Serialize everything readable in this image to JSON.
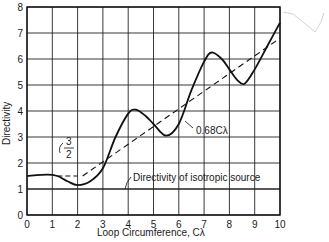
{
  "chart_data": {
    "type": "line",
    "title": "",
    "xlabel": "Loop Circumference, Cλ",
    "ylabel": "Directivity",
    "xlim": [
      0,
      10
    ],
    "ylim": [
      0,
      8
    ],
    "grid": true,
    "x_ticks": [
      "0",
      "1",
      "2",
      "3",
      "4",
      "5",
      "6",
      "7",
      "8",
      "9",
      "10"
    ],
    "y_ticks": [
      "0",
      "1",
      "2",
      "3",
      "4",
      "5",
      "6",
      "7",
      "8"
    ],
    "series": [
      {
        "name": "Directivity",
        "style": "solid",
        "x": [
          0,
          0.8,
          1.2,
          1.6,
          2.0,
          2.5,
          3.0,
          3.5,
          4.0,
          4.3,
          4.7,
          5.0,
          5.5,
          6.0,
          6.5,
          7.0,
          7.3,
          7.7,
          8.0,
          8.3,
          8.6,
          9.0,
          9.5,
          10.0
        ],
        "y": [
          1.5,
          1.55,
          1.5,
          1.3,
          1.15,
          1.3,
          1.8,
          3.0,
          3.9,
          4.05,
          3.8,
          3.5,
          3.05,
          3.5,
          4.8,
          5.9,
          6.25,
          6.0,
          5.6,
          5.2,
          5.05,
          5.6,
          6.5,
          7.4
        ]
      },
      {
        "name": "0.68Cλ",
        "style": "dashed",
        "x": [
          2.2,
          10.0
        ],
        "y": [
          1.5,
          6.8
        ]
      },
      {
        "name": "3/2 level",
        "style": "dashed",
        "x": [
          1.2,
          2.0
        ],
        "y": [
          1.5,
          1.5
        ]
      },
      {
        "name": "Directivity of isotropic source",
        "style": "solid",
        "x": [
          0,
          10
        ],
        "y": [
          1,
          1
        ]
      }
    ],
    "annotations": [
      {
        "text": "0.68Cλ",
        "x": 6.4,
        "y": 4.3
      },
      {
        "text": "3/2",
        "x": 1.6,
        "y": 2.0
      },
      {
        "text": "Directivity of isotropic source",
        "x": 3.9,
        "y": 1.3
      }
    ]
  },
  "labels": {
    "xlabel": "Loop Circumference, Cλ",
    "ylabel": "Directivity",
    "line_label": "0.68Cλ",
    "frac_num": "3",
    "frac_den": "2",
    "iso_label": "Directivity of isotropic source"
  }
}
